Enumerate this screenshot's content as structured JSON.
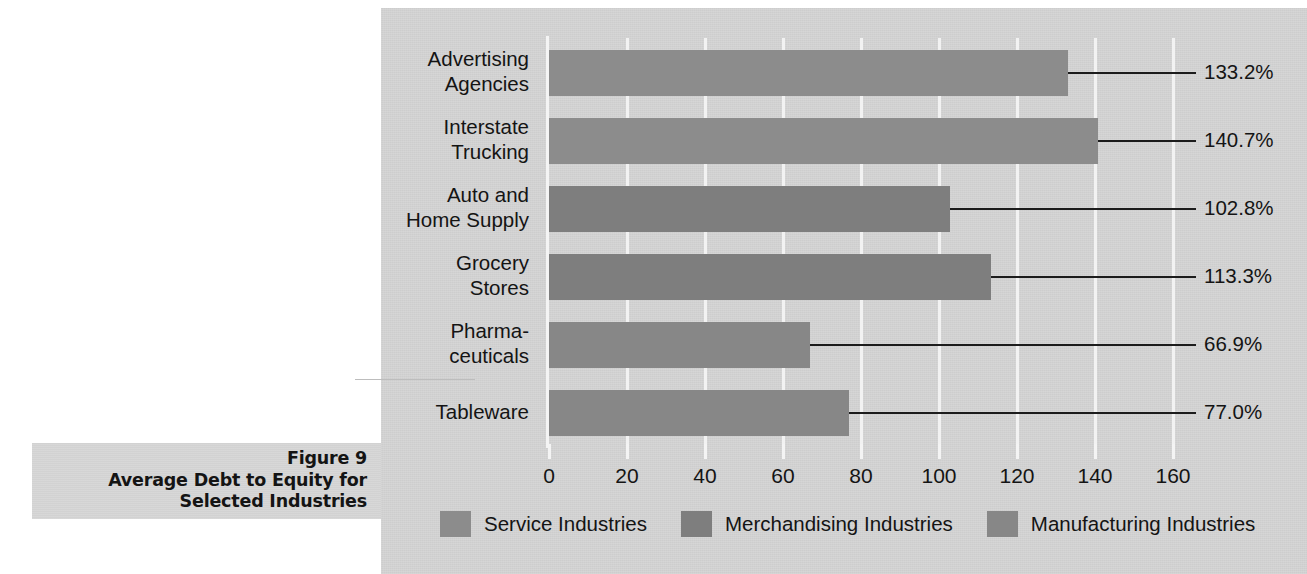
{
  "caption": {
    "line1": "Figure 9",
    "line2": "Average Debt to Equity for",
    "line3": "Selected Industries"
  },
  "chart_data": {
    "type": "bar",
    "orientation": "horizontal",
    "title": "Average Debt to Equity for Selected Industries",
    "figure_number": "Figure 9",
    "xlabel": "",
    "ylabel": "",
    "xlim": [
      0,
      160
    ],
    "xticks": [
      "0",
      "20",
      "40",
      "60",
      "80",
      "100",
      "120",
      "140",
      "160"
    ],
    "xtick_values": [
      0,
      20,
      40,
      60,
      80,
      100,
      120,
      140,
      160
    ],
    "grid": "vertical",
    "legend_position": "bottom",
    "categories": [
      "Advertising Agencies",
      "Interstate Trucking",
      "Auto and Home Supply",
      "Grocery Stores",
      "Pharmaceuticals",
      "Tableware"
    ],
    "category_lines": [
      [
        "Advertising",
        "Agencies"
      ],
      [
        "Interstate",
        "Trucking"
      ],
      [
        "Auto and",
        "Home Supply"
      ],
      [
        "Grocery",
        "Stores"
      ],
      [
        "Pharma-",
        "ceuticals"
      ],
      [
        "Tableware"
      ]
    ],
    "values": [
      133.2,
      140.7,
      102.8,
      113.3,
      66.9,
      77.0
    ],
    "data_labels": [
      "133.2%",
      "140.7%",
      "102.8%",
      "113.3%",
      "66.9%",
      "77.0%"
    ],
    "groups": [
      "Service Industries",
      "Service Industries",
      "Merchandising Industries",
      "Merchandising Industries",
      "Manufacturing Industries",
      "Manufacturing Industries"
    ],
    "series": [
      {
        "name": "Service Industries",
        "color": "#8c8c8c",
        "points": [
          {
            "category": "Advertising Agencies",
            "value": 133.2,
            "label": "133.2%"
          },
          {
            "category": "Interstate Trucking",
            "value": 140.7,
            "label": "140.7%"
          }
        ]
      },
      {
        "name": "Merchandising Industries",
        "color": "#7e7e7e",
        "points": [
          {
            "category": "Auto and Home Supply",
            "value": 102.8,
            "label": "102.8%"
          },
          {
            "category": "Grocery Stores",
            "value": 113.3,
            "label": "113.3%"
          }
        ]
      },
      {
        "name": "Manufacturing Industries",
        "color": "#878787",
        "points": [
          {
            "category": "Pharmaceuticals",
            "value": 66.9,
            "label": "66.9%"
          },
          {
            "category": "Tableware",
            "value": 77.0,
            "label": "77.0%"
          }
        ]
      }
    ],
    "legend": [
      {
        "label": "Service Industries",
        "color": "#8c8c8c"
      },
      {
        "label": "Merchandising Industries",
        "color": "#7e7e7e"
      },
      {
        "label": "Manufacturing Industries",
        "color": "#878787"
      }
    ],
    "colors": {
      "panel_background": "#d4d4d4",
      "gridline": "#f2f2f2",
      "axis": "#f4f4f4",
      "text": "#141414",
      "leader_line": "#1c1c1c",
      "caption_band": "#d6d6d6"
    }
  }
}
